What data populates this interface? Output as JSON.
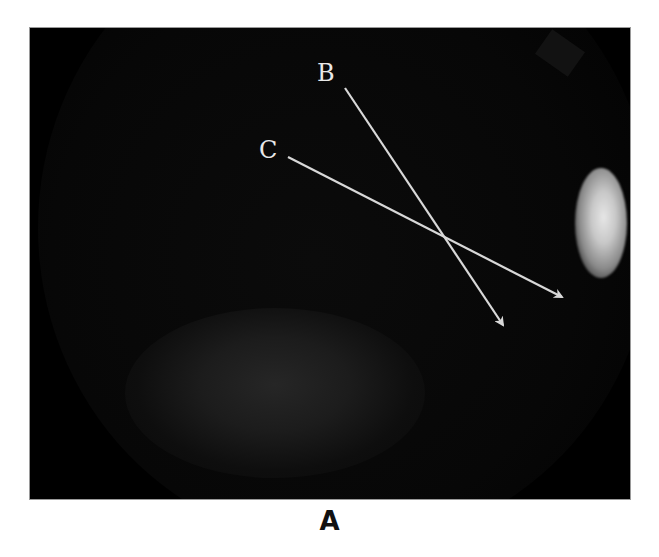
{
  "figure": {
    "panel_label": "A",
    "annotations": [
      {
        "label": "B",
        "from": [
          345,
          88
        ],
        "to": [
          503,
          325
        ]
      },
      {
        "label": "C",
        "from": [
          288,
          157
        ],
        "to": [
          562,
          297
        ]
      }
    ],
    "colors": {
      "background": "#000000",
      "arrow": "#d8d8d8",
      "label_text": "#e8e8e8",
      "panel_label": "#111111"
    }
  }
}
